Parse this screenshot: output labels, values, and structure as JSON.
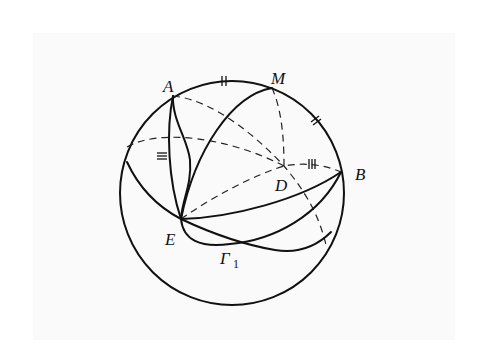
{
  "diagram": {
    "type": "spherical-geometry",
    "sphere": {
      "cx": 232,
      "cy": 193,
      "r": 112
    },
    "points": {
      "A": {
        "label": "A",
        "x": 173,
        "y": 96
      },
      "M": {
        "label": "M",
        "x": 272,
        "y": 88
      },
      "B": {
        "label": "B",
        "x": 341,
        "y": 172
      },
      "D": {
        "label": "D",
        "x": 284,
        "y": 166
      },
      "E": {
        "label": "E",
        "x": 181,
        "y": 219
      },
      "G1": {
        "label": "Γ",
        "subscript": "1",
        "x": 230,
        "y": 244
      }
    },
    "tick_marks": {
      "double_top": "||",
      "double_right": "||",
      "triple_left": "≡",
      "triple_DB": "|||"
    },
    "colors": {
      "stroke": "#111111",
      "background": "#ffffff",
      "panel": "#fafafa"
    }
  }
}
